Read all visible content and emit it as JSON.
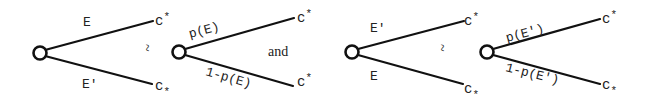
{
  "diagram": {
    "colors": {
      "ink": "#111111",
      "background": "#ffffff"
    },
    "tree1": {
      "upper_branch_label": "E",
      "lower_branch_label": "E'",
      "upper_outcome": "c",
      "upper_outcome_mark": "*",
      "lower_outcome": "c",
      "lower_outcome_mark": "*",
      "lower_outcome_mark_position": "subscript"
    },
    "relation1": "~",
    "tree2": {
      "upper_branch_label": "p(E)",
      "lower_branch_label": "1-p(E)",
      "upper_outcome": "c",
      "upper_outcome_mark": "*",
      "lower_outcome": "c",
      "lower_outcome_mark": "*",
      "lower_outcome_mark_position": "superscript"
    },
    "conjunction": "and",
    "tree3": {
      "upper_branch_label": "E'",
      "lower_branch_label": "E",
      "upper_outcome": "c",
      "upper_outcome_mark": "*",
      "lower_outcome": "c",
      "lower_outcome_mark": "*",
      "lower_outcome_mark_position": "subscript"
    },
    "relation2": "~",
    "tree4": {
      "upper_branch_label": "p(E')",
      "lower_branch_label": "1-p(E')",
      "upper_outcome": "c",
      "upper_outcome_mark": "*",
      "lower_outcome": "c",
      "lower_outcome_mark": "*",
      "lower_outcome_mark_position": "subscript"
    }
  }
}
